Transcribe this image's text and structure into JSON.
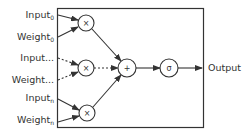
{
  "diagram": {
    "inputs": [
      {
        "label": "Input",
        "sub": "0"
      },
      {
        "label": "Weight",
        "sub": "0"
      },
      {
        "label": "Input...",
        "sub": ""
      },
      {
        "label": "Weight...",
        "sub": ""
      },
      {
        "label": "Input",
        "sub": "n"
      },
      {
        "label": "Weight",
        "sub": "n"
      }
    ],
    "nodes": {
      "mult_0": "×",
      "mult_mid": "×",
      "mult_n": "×",
      "sum": "+",
      "activation": "σ"
    },
    "output_label": "Output",
    "colors": {
      "stroke": "#333333",
      "text": "#333333",
      "background": "#ffffff"
    }
  }
}
